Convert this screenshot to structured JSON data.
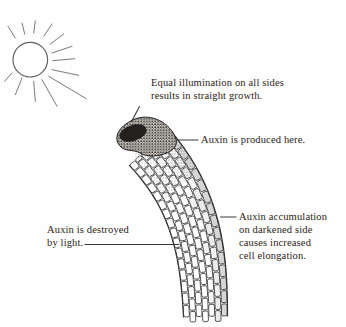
{
  "figure": {
    "labels": {
      "equal_illumination": {
        "lines": [
          "Equal illumination on all sides",
          "results in straight growth."
        ]
      },
      "auxin_produced": {
        "text": "Auxin is produced here."
      },
      "auxin_destroyed": {
        "lines": [
          "Auxin is destroyed",
          "by light."
        ]
      },
      "auxin_accumulation": {
        "lines": [
          "Auxin accumulation",
          "on darkened side",
          "causes increased",
          "cell elongation."
        ]
      }
    },
    "icons": {
      "sun": "sun-icon"
    },
    "colors": {
      "background": "#fefefe",
      "text": "#2e2318",
      "leader_line": "#3a3a3a",
      "cell_stroke": "#3e3e3e",
      "cell_fill": "#ffffff",
      "cell_shade_outer": "#d6d6d6",
      "cell_shade_inner": "#ececec",
      "tip_dark": "#232020",
      "stipple_dot": "#1f1d1b",
      "stipple_bg": "#d3cec8",
      "sun_stroke": "#606060",
      "sun_ray": "#7a7a7a"
    }
  }
}
